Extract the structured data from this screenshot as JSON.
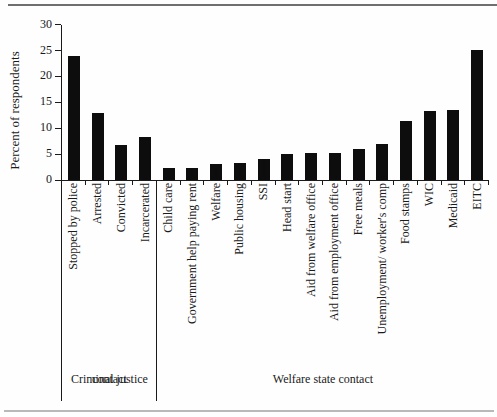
{
  "chart_data": {
    "type": "bar",
    "title": "",
    "xlabel": "",
    "ylabel": "Percent of respondents",
    "ylim": [
      0,
      30
    ],
    "yticks": [
      0,
      5,
      10,
      15,
      20,
      25,
      30
    ],
    "grid": false,
    "legend": "none",
    "bar_color": "#0d0d0d",
    "axis_color": "#1a1a1a",
    "categories": [
      "Stopped by police",
      "Arrested",
      "Convicted",
      "Incarcerated",
      "Child care",
      "Government help paying rent",
      "Welfare",
      "Public housing",
      "SSI",
      "Head start",
      "Aid from welfare office",
      "Aid from employment office",
      "Free meals",
      "Unemployment/ worker's comp",
      "Food stamps",
      "WIC",
      "Medicaid",
      "EITC"
    ],
    "values": [
      24,
      13,
      6.8,
      8.4,
      2.3,
      2.4,
      3.0,
      3.2,
      4.0,
      5.1,
      5.3,
      5.2,
      5.9,
      6.9,
      11.4,
      13.3,
      13.5,
      25.2
    ],
    "groups": [
      {
        "label": "Criminal justice contact",
        "label_lines": [
          "Criminal justice",
          "contact"
        ],
        "span": [
          0,
          4
        ]
      },
      {
        "label": "Welfare state contact",
        "label_lines": [
          "Welfare state contact"
        ],
        "span": [
          4,
          18
        ]
      }
    ]
  },
  "figure": {
    "top_rule_color": "#6f6f6f",
    "bottom_rule_color": "#b9b9b9"
  }
}
